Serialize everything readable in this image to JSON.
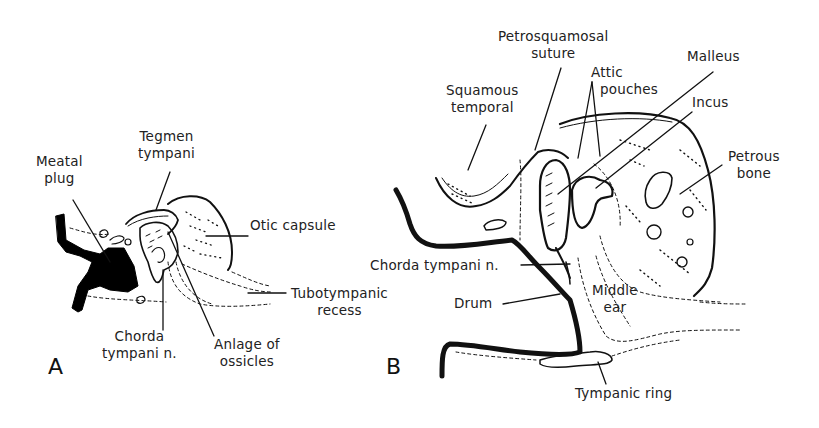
{
  "figure": {
    "panels": [
      {
        "id": "A",
        "label": "A",
        "annotations": {
          "meatal_plug": [
            "Meatal",
            "plug"
          ],
          "tegmen_tympani": [
            "Tegmen",
            "tympani"
          ],
          "otic_capsule": "Otic capsule",
          "tubotympanic_recess": [
            "Tubotympanic",
            "recess"
          ],
          "chorda_tympani": [
            "Chorda",
            "tympani n."
          ],
          "anlage_of_ossicles": [
            "Anlage of",
            "ossicles"
          ]
        }
      },
      {
        "id": "B",
        "label": "B",
        "annotations": {
          "petrosquamosal_suture": [
            "Petrosquamosal",
            "suture"
          ],
          "squamous_temporal": [
            "Squamous",
            "temporal"
          ],
          "attic_pouches": [
            "Attic",
            "pouches"
          ],
          "malleus": "Malleus",
          "incus": "Incus",
          "petrous_bone": [
            "Petrous",
            "bone"
          ],
          "chorda_tympani": "Chorda tympani n.",
          "drum": "Drum",
          "middle_ear": [
            "Middle",
            "ear"
          ],
          "tympanic_ring": "Tympanic ring"
        }
      }
    ]
  }
}
